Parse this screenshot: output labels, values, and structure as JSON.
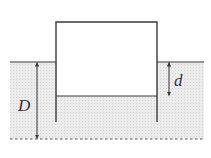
{
  "diagram": {
    "labels": {
      "D": "D",
      "d": "d"
    },
    "colors": {
      "line": "#3a3a3a",
      "water_fill": "#e6e6e6",
      "background": "#ffffff"
    },
    "geometry": {
      "water_surface_y": 62,
      "bottom_y": 139,
      "box_left_x": 56,
      "box_right_x": 157,
      "box_top_y": 22,
      "inner_floor_y": 96,
      "wall_bottom_y": 122
    }
  }
}
